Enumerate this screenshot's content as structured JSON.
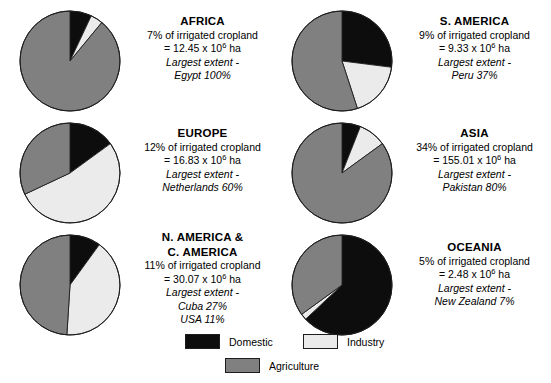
{
  "chart_data": {
    "type": "pie",
    "legend_position": "bottom",
    "categories": [
      "Domestic",
      "Industry",
      "Agriculture"
    ],
    "colors": {
      "domestic": "#0d0d0d",
      "industry": "#ebebeb",
      "agriculture": "#808080",
      "outline": "#1d1d1d",
      "background": "#ffffff"
    },
    "units": "percent of water withdrawal",
    "panels": [
      {
        "id": "africa",
        "region": "AFRICA",
        "share_text": "7% of irrigated cropland",
        "area_value": "12.45",
        "area_text": "= 12.45 x 10",
        "area_exponent": "6",
        "area_unit": " ha",
        "extent_label": "Largest extent -",
        "extent_items": [
          "Egypt 100%"
        ],
        "values": {
          "domestic": 7,
          "industry": 4,
          "agriculture": 89
        }
      },
      {
        "id": "s-america",
        "region": "S. AMERICA",
        "share_text": "9% of irrigated cropland",
        "area_value": "9.33",
        "area_text": "= 9.33 x 10",
        "area_exponent": "6",
        "area_unit": " ha",
        "extent_label": "Largest extent -",
        "extent_items": [
          "Peru 37%"
        ],
        "values": {
          "domestic": 27,
          "industry": 18,
          "agriculture": 55
        }
      },
      {
        "id": "europe",
        "region": "EUROPE",
        "share_text": "12% of irrigated cropland",
        "area_value": "16.83",
        "area_text": "= 16.83 x 10",
        "area_exponent": "6",
        "area_unit": " ha",
        "extent_label": "Largest extent -",
        "extent_items": [
          "Netherlands 60%"
        ],
        "values": {
          "domestic": 15,
          "industry": 53,
          "agriculture": 32
        }
      },
      {
        "id": "asia",
        "region": "ASIA",
        "share_text": "34% of irrigated cropland",
        "area_value": "155.01",
        "area_text": "= 155.01 x 10",
        "area_exponent": "6",
        "area_unit": " ha",
        "extent_label": "Largest extent -",
        "extent_items": [
          "Pakistan 80%"
        ],
        "values": {
          "domestic": 6,
          "industry": 9,
          "agriculture": 85
        }
      },
      {
        "id": "n-c-america",
        "region": "N. AMERICA &\nC. AMERICA",
        "share_text": "11% of irrigated cropland",
        "area_value": "30.07",
        "area_text": "= 30.07 x 10",
        "area_exponent": "6",
        "area_unit": " ha",
        "extent_label": "Largest extent -",
        "extent_items": [
          "Cuba 27%",
          "USA 11%"
        ],
        "values": {
          "domestic": 10,
          "industry": 41,
          "agriculture": 49
        }
      },
      {
        "id": "oceania",
        "region": "OCEANIA",
        "share_text": "5% of irrigated cropland",
        "area_value": "2.48",
        "area_text": "= 2.48 x 10",
        "area_exponent": "6",
        "area_unit": " ha",
        "extent_label": "Largest extent -",
        "extent_items": [
          "New Zealand 7%"
        ],
        "values": {
          "domestic": 63,
          "industry": 2,
          "agriculture": 35
        }
      }
    ]
  },
  "legend": {
    "items": [
      {
        "key": "domestic",
        "label": "Domestic"
      },
      {
        "key": "industry",
        "label": "Industry"
      },
      {
        "key": "agriculture",
        "label": "Agriculture"
      }
    ]
  }
}
